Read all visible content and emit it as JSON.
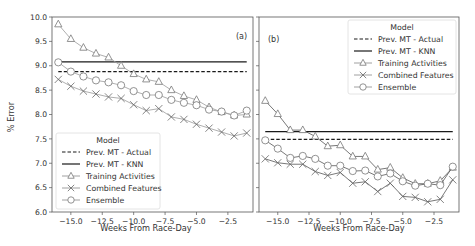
{
  "figure": {
    "ylabel": "% Error",
    "xlabel": "Weeks From Race-Day",
    "legend_title": "Model"
  },
  "chart_data": [
    {
      "type": "line",
      "panel": "(a)",
      "title": "",
      "xlabel": "Weeks From Race-Day",
      "ylabel": "% Error",
      "ylim": [
        6.0,
        10.0
      ],
      "xlim": [
        -16.5,
        -0.5
      ],
      "yticks": [
        "6.0",
        "6.5",
        "7.0",
        "7.5",
        "8.0",
        "8.5",
        "9.0",
        "9.5",
        "10.0"
      ],
      "xticks": [
        "-15.0",
        "-12.5",
        "-10.0",
        "-7.5",
        "-5.0",
        "-2.5"
      ],
      "legend_position": "lower left",
      "grid": false,
      "x": [
        -16,
        -15,
        -14,
        -13,
        -12,
        -11,
        -10,
        -9,
        -8,
        -7,
        -6,
        -5,
        -4,
        -3,
        -2,
        -1
      ],
      "series": [
        {
          "name": "Prev. MT - Actual",
          "style": "dashed",
          "values": [
            8.88,
            8.88,
            8.88,
            8.88,
            8.88,
            8.88,
            8.88,
            8.88,
            8.88,
            8.88,
            8.88,
            8.88,
            8.88,
            8.88,
            8.88,
            8.88
          ]
        },
        {
          "name": "Prev. MT - KNN",
          "style": "solid",
          "values": [
            9.08,
            9.08,
            9.08,
            9.08,
            9.08,
            9.08,
            9.08,
            9.08,
            9.08,
            9.08,
            9.08,
            9.08,
            9.08,
            9.08,
            9.08,
            9.08
          ]
        },
        {
          "name": "Training Activities",
          "marker": "triangle",
          "values": [
            9.85,
            9.55,
            9.37,
            9.25,
            9.17,
            9.0,
            8.83,
            8.72,
            8.67,
            8.5,
            8.38,
            8.3,
            8.15,
            8.05,
            7.98,
            8.0
          ]
        },
        {
          "name": "Combined Features",
          "marker": "x",
          "values": [
            8.72,
            8.58,
            8.48,
            8.42,
            8.36,
            8.33,
            8.2,
            8.08,
            8.12,
            7.95,
            7.9,
            7.8,
            7.72,
            7.64,
            7.56,
            7.62
          ]
        },
        {
          "name": "Ensemble",
          "marker": "circle",
          "values": [
            9.07,
            8.88,
            8.78,
            8.7,
            8.66,
            8.6,
            8.48,
            8.4,
            8.4,
            8.3,
            8.24,
            8.19,
            8.1,
            8.06,
            7.98,
            8.08
          ]
        }
      ]
    },
    {
      "type": "line",
      "panel": "(b)",
      "title": "",
      "xlabel": "Weeks From Race-Day",
      "ylabel": "",
      "ylim": [
        6.0,
        10.0
      ],
      "xlim": [
        -16.5,
        -0.5
      ],
      "yticks": [],
      "xticks": [
        "-15.0",
        "-12.5",
        "-10.0",
        "-7.5",
        "-5.0",
        "-2.5"
      ],
      "legend_position": "upper right",
      "grid": false,
      "x": [
        -16,
        -15,
        -14,
        -13,
        -12,
        -11,
        -10,
        -9,
        -8,
        -7,
        -6,
        -5,
        -4,
        -3,
        -2,
        -1
      ],
      "series": [
        {
          "name": "Prev. MT - Actual",
          "style": "dashed",
          "values": [
            7.49,
            7.49,
            7.49,
            7.49,
            7.49,
            7.49,
            7.49,
            7.49,
            7.49,
            7.49,
            7.49,
            7.49,
            7.49,
            7.49,
            7.49,
            7.49
          ]
        },
        {
          "name": "Prev. MT - KNN",
          "style": "solid",
          "values": [
            7.65,
            7.65,
            7.65,
            7.65,
            7.65,
            7.65,
            7.65,
            7.65,
            7.65,
            7.65,
            7.65,
            7.65,
            7.65,
            7.65,
            7.65,
            7.65
          ]
        },
        {
          "name": "Training Activities",
          "marker": "triangle",
          "values": [
            8.28,
            8.01,
            7.68,
            7.68,
            7.55,
            7.35,
            7.37,
            7.14,
            7.14,
            6.87,
            6.91,
            6.7,
            6.58,
            6.58,
            6.64,
            6.91
          ]
        },
        {
          "name": "Combined Features",
          "marker": "x",
          "values": [
            7.09,
            7.01,
            6.98,
            6.98,
            6.83,
            6.75,
            6.81,
            6.59,
            6.62,
            6.42,
            6.59,
            6.32,
            6.3,
            6.21,
            6.26,
            6.66
          ]
        },
        {
          "name": "Ensemble",
          "marker": "circle",
          "values": [
            7.47,
            7.3,
            7.11,
            7.15,
            7.09,
            6.95,
            6.95,
            6.84,
            6.85,
            6.73,
            6.79,
            6.63,
            6.54,
            6.58,
            6.55,
            6.93
          ]
        }
      ]
    }
  ],
  "colors": {
    "line_gray": "#8a8a8a",
    "ref_line": "#1a1a1a",
    "frame": "#555555",
    "text": "#333333",
    "legend_border": "#dddddd"
  }
}
